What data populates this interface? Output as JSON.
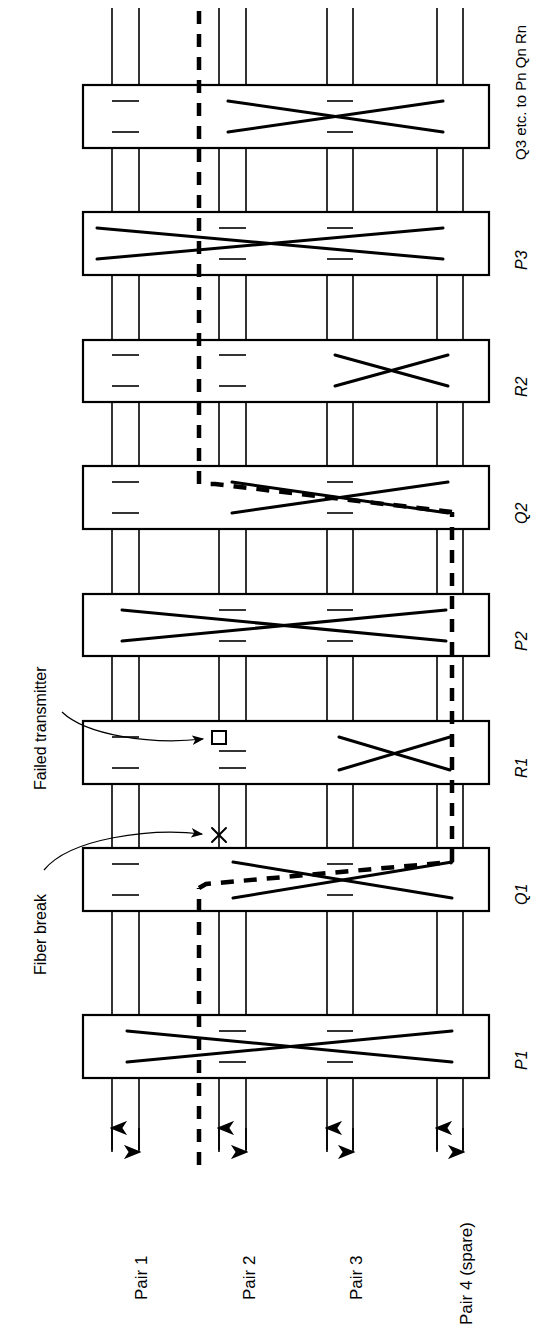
{
  "diagram": {
    "type": "fiber-ring-protection-schematic",
    "orientation": "rotated-90-ccw",
    "title_visible": false,
    "annotations": [
      {
        "id": "failed-transmitter",
        "label": "Failed transmitter",
        "points_to": "R1 node, Pair 2 transmitter",
        "marker": "small-square"
      },
      {
        "id": "fiber-break",
        "label": "Fiber break",
        "points_to": "Pair 2 span between Q1 and R1",
        "marker": "x-cross"
      }
    ],
    "pairs": [
      {
        "id": "pair1",
        "label": "Pair 1",
        "lines": [
          {
            "dir": "up"
          },
          {
            "dir": "down"
          }
        ]
      },
      {
        "id": "pair2",
        "label": "Pair 2",
        "lines": [
          {
            "dir": "up"
          },
          {
            "dir": "down"
          }
        ]
      },
      {
        "id": "pair3",
        "label": "Pair 3",
        "lines": [
          {
            "dir": "up"
          },
          {
            "dir": "down"
          }
        ]
      },
      {
        "id": "pair4",
        "label": "Pair 4 (spare)",
        "lines": [
          {
            "dir": "up"
          },
          {
            "dir": "down"
          }
        ]
      }
    ],
    "nodes": [
      {
        "id": "p1",
        "label": "P1",
        "crossconnect": "full-span-pairs-1-to-4",
        "taps": [
          "pair2",
          "pair3"
        ],
        "dashed_path": false
      },
      {
        "id": "q1",
        "label": "Q1",
        "crossconnect": "pairs-2-to-4",
        "taps": [
          "pair1",
          "pair3"
        ],
        "dashed_path": true
      },
      {
        "id": "r1",
        "label": "R1",
        "crossconnect": "pairs-3-to-4",
        "taps": [
          "pair1",
          "pair2"
        ],
        "dashed_path": false,
        "fault": "failed-transmitter"
      },
      {
        "id": "p2",
        "label": "P2",
        "crossconnect": "full-span-pairs-1-to-4",
        "taps": [
          "pair2",
          "pair3"
        ],
        "dashed_path": false
      },
      {
        "id": "q2",
        "label": "Q2",
        "crossconnect": "pairs-2-to-4",
        "taps": [
          "pair3"
        ],
        "dashed_path": true
      },
      {
        "id": "r2",
        "label": "R2",
        "crossconnect": "pairs-3-to-4",
        "taps": [
          "pair1",
          "pair2"
        ],
        "dashed_path": false
      },
      {
        "id": "p3",
        "label": "P3",
        "crossconnect": "full-span-pairs-1-to-4",
        "taps": [
          "pair2",
          "pair3"
        ],
        "dashed_path": false
      },
      {
        "id": "qn",
        "label": "Q3 etc. to Pn Qn Rn",
        "crossconnect": "pairs-2-to-4",
        "taps": [
          "pair1",
          "pair3"
        ],
        "dashed_path": false
      }
    ],
    "protection_path": {
      "id": "dashed-protection-route",
      "style": "thick-dashed",
      "description": "Traffic rerouted onto Pair 4 (spare) between Q1 and Q2, running alongside Pair 2 elsewhere"
    },
    "colors": {
      "ink": "#000000",
      "background": "#ffffff"
    }
  }
}
